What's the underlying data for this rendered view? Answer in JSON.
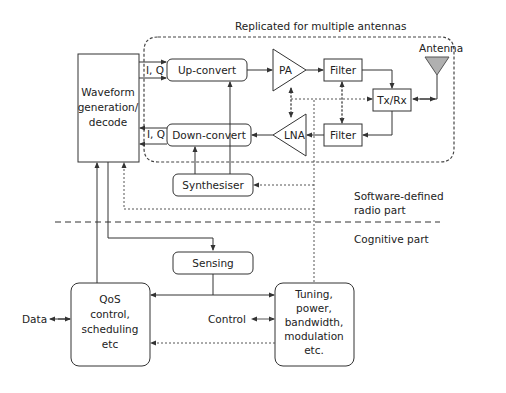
{
  "regions": {
    "replicated_label": "Replicated for multiple antennas",
    "sdr_label_line1": "Software-defined",
    "sdr_label_line2": "radio part",
    "cognitive_label": "Cognitive part"
  },
  "blocks": {
    "waveform": [
      "Waveform",
      "generation/",
      "decode"
    ],
    "upconvert": "Up-convert",
    "downconvert": "Down-convert",
    "iq_up": "I, Q",
    "iq_down": "I, Q",
    "pa": "PA",
    "lna": "LNA",
    "filter_top": "Filter",
    "filter_bottom": "Filter",
    "txrx": "Tx/Rx",
    "antenna": "Antenna",
    "synthesiser": "Synthesiser",
    "sensing": "Sensing",
    "qos": [
      "QoS",
      "control,",
      "scheduling",
      "etc"
    ],
    "tuning": [
      "Tuning,",
      "power,",
      "bandwidth,",
      "modulation",
      "etc."
    ]
  },
  "externals": {
    "data": "Data",
    "control": "Control"
  },
  "colors": {
    "line": "#333333",
    "antenna_fill": "#b0b0b0"
  }
}
